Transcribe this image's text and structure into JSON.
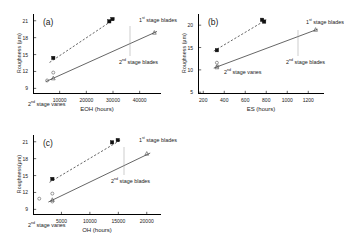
{
  "figure": {
    "background": "#ffffff",
    "axis_color": "#000000",
    "series_colors": {
      "first_stage_blades": "#1a1a1a",
      "second_stage_blades": "#1a1a1a",
      "second_stage_vanes": "#555555"
    }
  },
  "chart_data": [
    {
      "type": "scatter",
      "panel": "(a)",
      "title": "",
      "xlabel": "EOH (hours)",
      "ylabel": "Roughness (µm)",
      "xlim": [
        0,
        48000
      ],
      "ylim": [
        8,
        22.2
      ],
      "xticks": [
        "10000",
        "20000",
        "30000",
        "40000"
      ],
      "xtick_values": [
        10000,
        20000,
        30000,
        40000
      ],
      "yticks": [
        "9",
        "12",
        "15",
        "18",
        "21"
      ],
      "ytick_values": [
        9,
        12,
        15,
        18,
        21
      ],
      "grid": false,
      "legend_position": "inline-annotations",
      "annotations": [
        {
          "text": "1st stage blades",
          "sup": "st"
        },
        {
          "text": "2nd stage blades",
          "sup": "nd"
        },
        {
          "text": "2nd stage vanes",
          "sup": "nd"
        }
      ],
      "series": [
        {
          "name": "1st stage blades",
          "marker": "filled-square",
          "line": "dashed",
          "points": [
            [
              7600,
              14.4
            ],
            [
              28600,
              20.9
            ],
            [
              29800,
              21.3
            ]
          ],
          "fit": [
            [
              6200,
              13.6
            ],
            [
              30500,
              21.3
            ]
          ]
        },
        {
          "name": "2nd stage blades",
          "marker": "open-triangle",
          "line": "solid",
          "points": [
            [
              7600,
              10.8
            ],
            [
              45500,
              18.9
            ]
          ],
          "fit": [
            [
              4800,
              10.2
            ],
            [
              46500,
              19.1
            ]
          ]
        },
        {
          "name": "2nd stage vanes",
          "marker": "open-circle",
          "line": "none",
          "points": [
            [
              5300,
              10.4
            ],
            [
              7600,
              11.8
            ]
          ]
        }
      ]
    },
    {
      "type": "scatter",
      "panel": "(b)",
      "title": "",
      "xlabel": "ES (hours)",
      "ylabel": "Roughness (µm)",
      "xlim": [
        150,
        1350
      ],
      "ylim": [
        4.6,
        22.5
      ],
      "xticks": [
        "200",
        "400",
        "600",
        "800",
        "1000",
        "1200"
      ],
      "xtick_values": [
        200,
        400,
        600,
        800,
        1000,
        1200
      ],
      "yticks": [
        "5",
        "10",
        "15",
        "20"
      ],
      "ytick_values": [
        5,
        10,
        15,
        20
      ],
      "grid": false,
      "legend_position": "inline-annotations",
      "annotations": [
        {
          "text": "1st stage blades",
          "sup": "st"
        },
        {
          "text": "2nd stage blades",
          "sup": "nd"
        },
        {
          "text": "2nd stage vanes",
          "sup": "nd"
        }
      ],
      "series": [
        {
          "name": "1st stage blades",
          "marker": "filled-square",
          "line": "dashed",
          "points": [
            [
              330,
              14.4
            ],
            [
              760,
              21.2
            ],
            [
              780,
              20.8
            ]
          ],
          "fit": [
            [
              300,
              14.2
            ],
            [
              800,
              21.2
            ]
          ]
        },
        {
          "name": "2nd stage blades",
          "marker": "open-triangle",
          "line": "solid",
          "points": [
            [
              330,
              10.6
            ],
            [
              1270,
              19.0
            ]
          ],
          "fit": [
            [
              300,
              10.4
            ],
            [
              1290,
              19.1
            ]
          ]
        },
        {
          "name": "2nd stage vanes",
          "marker": "open-circle",
          "line": "none",
          "points": [
            [
              330,
              11.6
            ],
            [
              335,
              10.8
            ]
          ]
        }
      ]
    },
    {
      "type": "scatter",
      "panel": "(c)",
      "title": "",
      "xlabel": "OH (hours)",
      "ylabel": "Roughness(µm)",
      "xlim": [
        0,
        22500
      ],
      "ylim": [
        8,
        22.2
      ],
      "xticks": [
        "5000",
        "10000",
        "15000",
        "20000"
      ],
      "xtick_values": [
        5000,
        10000,
        15000,
        20000
      ],
      "yticks": [
        "9",
        "12",
        "15",
        "18",
        "21"
      ],
      "ytick_values": [
        9,
        12,
        15,
        18,
        21
      ],
      "grid": false,
      "legend_position": "inline-annotations",
      "annotations": [
        {
          "text": "1st stage blades",
          "sup": "st"
        },
        {
          "text": "2nd stage blades",
          "sup": "nd"
        },
        {
          "text": "2nd stage vanes",
          "sup": "nd"
        }
      ],
      "series": [
        {
          "name": "1st stage blades",
          "marker": "filled-square",
          "line": "dashed",
          "points": [
            [
              3400,
              14.4
            ],
            [
              13900,
              20.9
            ],
            [
              14900,
              21.3
            ]
          ],
          "fit": [
            [
              2900,
              13.8
            ],
            [
              15400,
              21.3
            ]
          ]
        },
        {
          "name": "2nd stage blades",
          "marker": "open-triangle",
          "line": "solid",
          "points": [
            [
              3400,
              10.7
            ],
            [
              20000,
              18.9
            ]
          ],
          "fit": [
            [
              2700,
              10.3
            ],
            [
              20600,
              19.0
            ]
          ]
        },
        {
          "name": "2nd stage vanes",
          "marker": "open-circle",
          "line": "none",
          "points": [
            [
              1100,
              10.9
            ],
            [
              3400,
              11.8
            ],
            [
              3400,
              10.4
            ]
          ]
        }
      ]
    }
  ]
}
